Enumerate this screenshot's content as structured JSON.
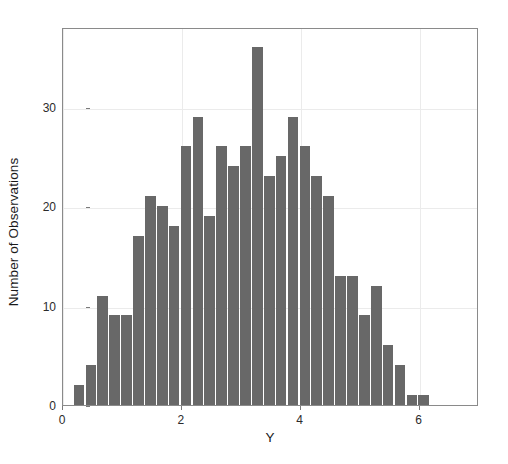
{
  "chart_data": {
    "type": "bar",
    "title": "",
    "subtitle": "",
    "xlabel": "Y",
    "ylabel": "Number of Observations",
    "xlim": [
      0.0,
      7.0
    ],
    "ylim": [
      0,
      38
    ],
    "xticks": [
      0,
      2,
      4,
      6
    ],
    "xtick_labels": [
      "0",
      "2",
      "4",
      "6"
    ],
    "yticks": [
      0,
      10,
      20,
      30
    ],
    "ytick_labels": [
      "0",
      "10",
      "20",
      "30"
    ],
    "grid": "major-light-gray",
    "legend": "none",
    "bar_color": "#686868",
    "panel_border_color": "#8a8a8a",
    "bin_width": 0.2,
    "bin_start": 0.17,
    "bin_edges": [
      0.17,
      0.37,
      0.57,
      0.77,
      0.97,
      1.17,
      1.37,
      1.57,
      1.77,
      1.97,
      2.17,
      2.37,
      2.57,
      2.77,
      2.97,
      3.17,
      3.37,
      3.57,
      3.77,
      3.97,
      4.17,
      4.37,
      4.57,
      4.77,
      4.97,
      5.17,
      5.37,
      5.57,
      5.77,
      5.97,
      6.17,
      6.37,
      6.57,
      6.77,
      6.97
    ],
    "bin_centers": [
      0.27,
      0.47,
      0.67,
      0.87,
      1.07,
      1.27,
      1.47,
      1.67,
      1.87,
      2.07,
      2.27,
      2.47,
      2.67,
      2.87,
      3.07,
      3.27,
      3.47,
      3.67,
      3.87,
      4.07,
      4.27,
      4.47,
      4.67,
      4.87,
      5.07,
      5.27,
      5.47,
      5.67,
      5.87,
      6.07,
      6.27,
      6.47,
      6.67,
      6.87
    ],
    "categories": [
      "0.27",
      "0.47",
      "0.67",
      "0.87",
      "1.07",
      "1.27",
      "1.47",
      "1.67",
      "1.87",
      "2.07",
      "2.27",
      "2.47",
      "2.67",
      "2.87",
      "3.07",
      "3.27",
      "3.47",
      "3.67",
      "3.87",
      "4.07",
      "4.27",
      "4.47",
      "4.67",
      "4.87",
      "5.07",
      "5.27",
      "5.47",
      "5.67",
      "5.87",
      "6.07",
      "6.27",
      "6.47",
      "6.67",
      "6.87"
    ],
    "values": [
      2,
      4,
      11,
      9,
      9,
      17,
      21,
      20,
      18,
      26,
      29,
      19,
      26,
      24,
      26,
      36,
      23,
      25,
      29,
      26,
      23,
      21,
      13,
      13,
      9,
      12,
      6,
      4,
      1,
      1,
      0,
      0,
      0,
      0
    ],
    "total_observations": 492
  }
}
